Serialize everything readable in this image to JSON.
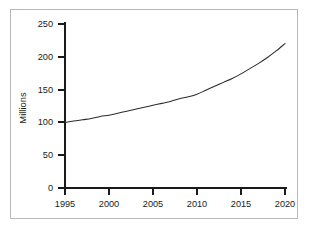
{
  "figure": {
    "background_color": "#ffffff",
    "frame_color": "#b9b9b9",
    "axis_color": "#1a1a1a",
    "curve_color": "#2b2b2b"
  },
  "chart_data": {
    "type": "line",
    "title": "",
    "subtitle": "",
    "xlabel": "",
    "ylabel": "Millions",
    "xlim": [
      1995,
      2020
    ],
    "ylim": [
      0,
      250
    ],
    "grid": false,
    "legend": false,
    "legend_position": "none",
    "xticks": [
      1995,
      2000,
      2005,
      2010,
      2015,
      2020
    ],
    "xtick_labels": [
      "1995",
      "2000",
      "2005",
      "2010",
      "2015",
      "2020"
    ],
    "yticks": [
      0,
      50,
      100,
      150,
      200,
      250
    ],
    "ytick_labels": [
      "0",
      "50",
      "100",
      "150",
      "200",
      "250"
    ],
    "series": [
      {
        "name": "",
        "x": [
          1995,
          1996,
          1997,
          1998,
          1999,
          2000,
          2001,
          2002,
          2003,
          2004,
          2005,
          2006,
          2007,
          2008,
          2009,
          2010,
          2011,
          2012,
          2013,
          2014,
          2015,
          2016,
          2017,
          2018,
          2019,
          2020
        ],
        "values": [
          100,
          102,
          104,
          106,
          109,
          111,
          114,
          117,
          120,
          123,
          126,
          129,
          132,
          136,
          139,
          143,
          149,
          155,
          161,
          167,
          174,
          182,
          190,
          199,
          209,
          220
        ]
      }
    ],
    "annotations": []
  },
  "axis_labels": {
    "y_title": "Millions"
  }
}
